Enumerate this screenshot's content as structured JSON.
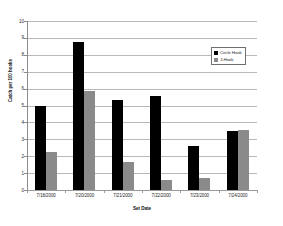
{
  "chart_data": {
    "type": "bar",
    "title": "",
    "xlabel": "Set Date",
    "ylabel": "Catch per 100 hooks",
    "ylim": [
      0,
      10
    ],
    "ytick_step": 1,
    "grid": "horizontal",
    "legend_position": "inside-upper-right",
    "categories": [
      "7/18/2000",
      "7/20/2000",
      "7/21/2000",
      "7/22/2000",
      "7/23/2000",
      "7/24/2000"
    ],
    "yticks": [
      "0",
      "1",
      "2",
      "3",
      "4",
      "5",
      "6",
      "7",
      "8",
      "9",
      "10"
    ],
    "series": [
      {
        "name": "Circle Hook",
        "color": "#000000",
        "values": [
          5.0,
          8.75,
          5.35,
          5.55,
          2.6,
          3.5
        ]
      },
      {
        "name": "J-Hook",
        "color": "#8a8a8a",
        "values": [
          2.25,
          5.85,
          1.65,
          0.6,
          0.7,
          3.55
        ]
      }
    ]
  },
  "colors": {
    "circle_hook": "#000000",
    "j_hook": "#8a8a8a",
    "gridline": "#b9b9b9",
    "axis": "#8c8c8c",
    "background": "#ffffff"
  }
}
